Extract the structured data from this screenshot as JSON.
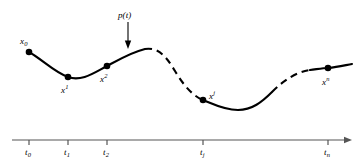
{
  "figure": {
    "background_color": "#ffffff",
    "stroke_color": "#000000",
    "axis_color": "#555555",
    "width": 362,
    "height": 165
  },
  "annotations": {
    "function_label": "p(t)",
    "function_label_name": "p-of-t-label",
    "arrow_name": "p-of-t-pointer-arrow"
  },
  "points": [
    {
      "id": "x0",
      "base": "x",
      "script": "0",
      "script_type": "sub",
      "label": "x0",
      "x": 29,
      "y": 52,
      "label_x": 20,
      "label_y": 37
    },
    {
      "id": "x1",
      "base": "x",
      "script": "1",
      "script_type": "sup",
      "label": "x1",
      "x": 68,
      "y": 77,
      "label_x": 61,
      "label_y": 86
    },
    {
      "id": "x2",
      "base": "x",
      "script": "2",
      "script_type": "sup",
      "label": "x2",
      "x": 107,
      "y": 66,
      "label_x": 100,
      "label_y": 75
    },
    {
      "id": "xj",
      "base": "x",
      "script": "j",
      "script_type": "sup",
      "label": "xj",
      "x": 203,
      "y": 100,
      "label_x": 209,
      "label_y": 92
    },
    {
      "id": "xn",
      "base": "x",
      "script": "n",
      "script_type": "sup",
      "label": "xn",
      "x": 328,
      "y": 68,
      "label_x": 322,
      "label_y": 78
    }
  ],
  "axis": {
    "name": "time-axis",
    "y": 140,
    "x_start": 12,
    "x_end": 352,
    "arrowhead": true,
    "tick_height": 5,
    "ticks": [
      {
        "id": "t0",
        "base": "t",
        "script": "0",
        "label": "t0",
        "x": 29,
        "label_x": 25,
        "label_y": 148
      },
      {
        "id": "t1",
        "base": "t",
        "script": "1",
        "label": "t1",
        "x": 68,
        "label_x": 64,
        "label_y": 148
      },
      {
        "id": "t2",
        "base": "t",
        "script": "2",
        "label": "t2",
        "x": 107,
        "label_x": 103,
        "label_y": 148
      },
      {
        "id": "tj",
        "base": "t",
        "script": "j",
        "label": "tj",
        "x": 203,
        "label_x": 200,
        "label_y": 148
      },
      {
        "id": "tn",
        "base": "t",
        "script": "n",
        "label": "tn",
        "x": 328,
        "label_x": 324,
        "label_y": 148
      }
    ]
  },
  "curve": {
    "name": "interpolating-curve",
    "stroke_width": 2.1,
    "segments": [
      {
        "id": "segment-solid-1",
        "style": "solid",
        "path": "M 29 52 C 43 60, 54 72, 68 77 C 82 82, 95 72, 107 66 C 120 59, 132 52, 145 49"
      },
      {
        "id": "segment-dashed-1",
        "style": "dashed",
        "path": "M 145 49 C 158 47, 166 56, 175 71 C 184 86, 193 96, 203 100"
      },
      {
        "id": "segment-solid-2",
        "style": "solid",
        "path": "M 203 100 C 213 104, 224 110, 238 110 C 252 110, 262 102, 272 92"
      },
      {
        "id": "segment-dashed-2",
        "style": "dashed",
        "path": "M 272 92 C 285 79, 297 72, 310 70"
      },
      {
        "id": "segment-solid-3",
        "style": "solid",
        "path": "M 310 70 C 318 69, 323 68, 328 68 C 338 67, 346 65, 352 64"
      }
    ],
    "dash_pattern": "7 5"
  }
}
